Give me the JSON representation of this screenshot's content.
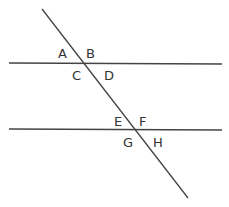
{
  "diagram": {
    "colors": {
      "line": "#444444",
      "label": "#333333",
      "background": "#ffffff"
    },
    "lines": [
      {
        "id": "parallel-top",
        "x1": 9,
        "y1": 63,
        "x2": 222,
        "y2": 64
      },
      {
        "id": "parallel-bottom",
        "x1": 9,
        "y1": 129,
        "x2": 222,
        "y2": 130
      },
      {
        "id": "transversal",
        "x1": 42,
        "y1": 9,
        "x2": 188,
        "y2": 198
      }
    ],
    "labels": [
      {
        "text": "A",
        "x": 58,
        "y": 58
      },
      {
        "text": "B",
        "x": 86,
        "y": 58
      },
      {
        "text": "C",
        "x": 72,
        "y": 80
      },
      {
        "text": "D",
        "x": 104,
        "y": 80
      },
      {
        "text": "E",
        "x": 114,
        "y": 126
      },
      {
        "text": "F",
        "x": 139,
        "y": 126
      },
      {
        "text": "G",
        "x": 123,
        "y": 147
      },
      {
        "text": "H",
        "x": 153,
        "y": 147
      }
    ]
  }
}
